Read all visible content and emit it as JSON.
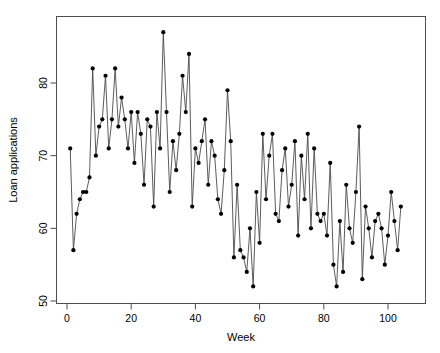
{
  "chart_data": {
    "type": "line",
    "title": "",
    "subtitle": "",
    "xlabel": "Week",
    "ylabel": "Loan applications",
    "xlim": [
      0,
      105
    ],
    "ylim": [
      50,
      88
    ],
    "xticks": [
      0,
      20,
      40,
      60,
      80,
      100
    ],
    "yticks": [
      50,
      60,
      70,
      80
    ],
    "grid": false,
    "legend": null,
    "marker": "filled-circle",
    "line_color": "#4a4a4a",
    "marker_color": "#000000",
    "x": [
      1,
      2,
      3,
      4,
      5,
      6,
      7,
      8,
      9,
      10,
      11,
      12,
      13,
      14,
      15,
      16,
      17,
      18,
      19,
      20,
      21,
      22,
      23,
      24,
      25,
      26,
      27,
      28,
      29,
      30,
      31,
      32,
      33,
      34,
      35,
      36,
      37,
      38,
      39,
      40,
      41,
      42,
      43,
      44,
      45,
      46,
      47,
      48,
      49,
      50,
      51,
      52,
      53,
      54,
      55,
      56,
      57,
      58,
      59,
      60,
      61,
      62,
      63,
      64,
      65,
      66,
      67,
      68,
      69,
      70,
      71,
      72,
      73,
      74,
      75,
      76,
      77,
      78,
      79,
      80,
      81,
      82,
      83,
      84,
      85,
      86,
      87,
      88,
      89,
      90,
      91,
      92,
      93,
      94,
      95,
      96,
      97,
      98,
      99,
      100,
      101,
      102,
      103,
      104
    ],
    "values": [
      71,
      57,
      62,
      64,
      65,
      65,
      67,
      82,
      70,
      74,
      75,
      81,
      71,
      75,
      82,
      74,
      78,
      75,
      71,
      76,
      69,
      76,
      73,
      66,
      75,
      74,
      63,
      76,
      71,
      87,
      76,
      65,
      72,
      68,
      73,
      81,
      76,
      84,
      63,
      71,
      69,
      72,
      75,
      66,
      72,
      70,
      64,
      62,
      68,
      79,
      72,
      56,
      66,
      57,
      56,
      54,
      60,
      52,
      65,
      58,
      73,
      64,
      70,
      73,
      62,
      61,
      68,
      71,
      63,
      66,
      72,
      59,
      70,
      64,
      73,
      60,
      71,
      62,
      61,
      62,
      59,
      69,
      55,
      52,
      61,
      54,
      66,
      60,
      58,
      65,
      74,
      53,
      63,
      60,
      56,
      61,
      62,
      60,
      55,
      59,
      65,
      61,
      57,
      63
    ]
  },
  "axes": {
    "y_tick_labels": [
      "50",
      "60",
      "70",
      "80"
    ],
    "x_tick_labels": [
      "0",
      "20",
      "40",
      "60",
      "80",
      "100"
    ]
  }
}
